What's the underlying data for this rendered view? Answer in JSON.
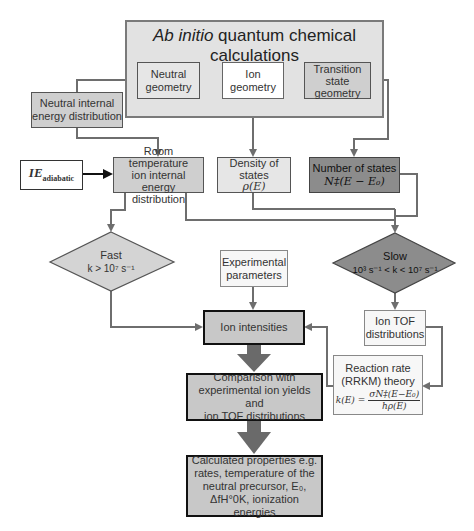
{
  "diagram": {
    "top_box": {
      "title_italic": "Ab initio",
      "title_rest": " quantum chemical calculations"
    },
    "nodes": {
      "neutral_geometry": {
        "line1": "Neutral",
        "line2": "geometry"
      },
      "ion_geometry": {
        "line1": "Ion",
        "line2": "geometry"
      },
      "transition_state_geometry": {
        "line1": "Transition",
        "line2": "state",
        "line3": "geometry"
      },
      "neutral_internal_energy": {
        "line1": "Neutral internal",
        "line2": "energy distribution"
      },
      "ie_adiabatic": {
        "main": "IE",
        "sub": "adiabatic"
      },
      "room_temperature": {
        "line1": "Room temperature",
        "line2": "ion internal energy",
        "line3": "distribution"
      },
      "density_of_states": {
        "line1": "Density of",
        "line2": "states",
        "math": "ρ(E)"
      },
      "number_of_states": {
        "line1": "Number of states",
        "math": "N‡(E − E₀)"
      },
      "fast": {
        "label": "Fast",
        "condition": "k > 10⁷ s⁻¹"
      },
      "slow": {
        "label": "Slow",
        "condition": "10³ s⁻¹ < k < 10⁷ s⁻¹"
      },
      "experimental_parameters": {
        "line1": "Experimental",
        "line2": "parameters"
      },
      "ion_tof": {
        "line1": "Ion TOF",
        "line2": "distributions"
      },
      "ion_intensities": {
        "label": "Ion intensities"
      },
      "rrkm": {
        "line1": "Reaction rate",
        "line2": "(RRKM) theory",
        "lhs": "k(E) =",
        "numerator": "σN‡(E−E₀)",
        "denominator": "hρ(E)"
      },
      "comparison": {
        "line1": "Comparison with",
        "line2": "experimental ion yields and",
        "line3": "ion TOF distributions"
      },
      "calculated": {
        "line1": "Calculated properties e.g.",
        "line2": "rates, temperature of the",
        "line3": "neutral precursor, E₀,",
        "line4": "ΔfH°0K, ionization energies"
      }
    },
    "colors": {
      "line": "#6e6e6e",
      "top_box_fill": "#e2e2e2",
      "dark_fill": "#8c8c8c",
      "mid_fill": "#cfcfcf",
      "big_arrow": "#6a6a6a"
    }
  }
}
